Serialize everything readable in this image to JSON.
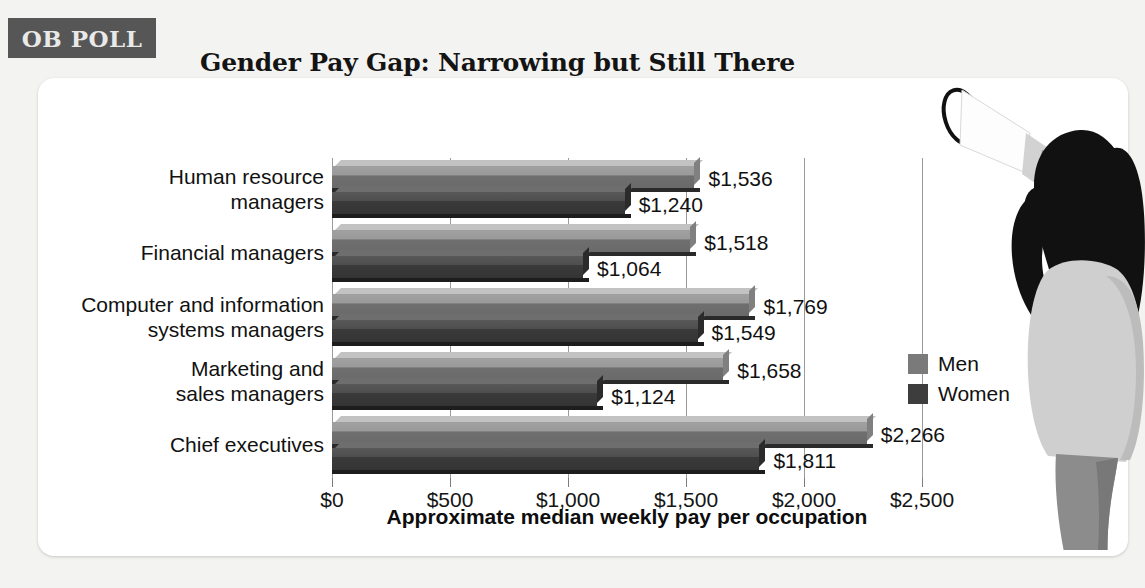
{
  "badge": {
    "label": "OB POLL"
  },
  "header": {
    "title": "Gender Pay Gap: Narrowing but Still There"
  },
  "legend": {
    "position": "right",
    "items": [
      {
        "label": "Men",
        "color": "#7a7a7a"
      },
      {
        "label": "Women",
        "color": "#3d3d3d"
      }
    ]
  },
  "axis": {
    "title": "Approximate median weekly pay per occupation",
    "ticks": [
      "$0",
      "$500",
      "$1,000",
      "$1,500",
      "$2,000",
      "$2,500"
    ]
  },
  "illustration": {
    "name": "woman-with-megaphone"
  },
  "chart_data": {
    "type": "bar",
    "orientation": "horizontal",
    "title": "Gender Pay Gap: Narrowing but Still There",
    "xlabel": "Approximate median weekly pay per occupation",
    "ylabel": "",
    "xlim": [
      0,
      2500
    ],
    "xticks": [
      0,
      500,
      1000,
      1500,
      2000,
      2500
    ],
    "xtick_labels": [
      "$0",
      "$500",
      "$1,000",
      "$1,500",
      "$2,000",
      "$2,500"
    ],
    "grid": true,
    "legend_position": "right",
    "categories": [
      "Human resource\nmanagers",
      "Financial managers",
      "Computer and information\nsystems managers",
      "Marketing and\nsales managers",
      "Chief executives"
    ],
    "series": [
      {
        "name": "Men",
        "color": "#7a7a7a",
        "values": [
          1536,
          1518,
          1769,
          1658,
          2266
        ],
        "labels": [
          "$1,536",
          "$1,518",
          "$1,769",
          "$1,658",
          "$2,266"
        ]
      },
      {
        "name": "Women",
        "color": "#3d3d3d",
        "values": [
          1240,
          1064,
          1549,
          1124,
          1811
        ],
        "labels": [
          "$1,240",
          "$1,064",
          "$1,549",
          "$1,124",
          "$1,811"
        ]
      }
    ]
  }
}
